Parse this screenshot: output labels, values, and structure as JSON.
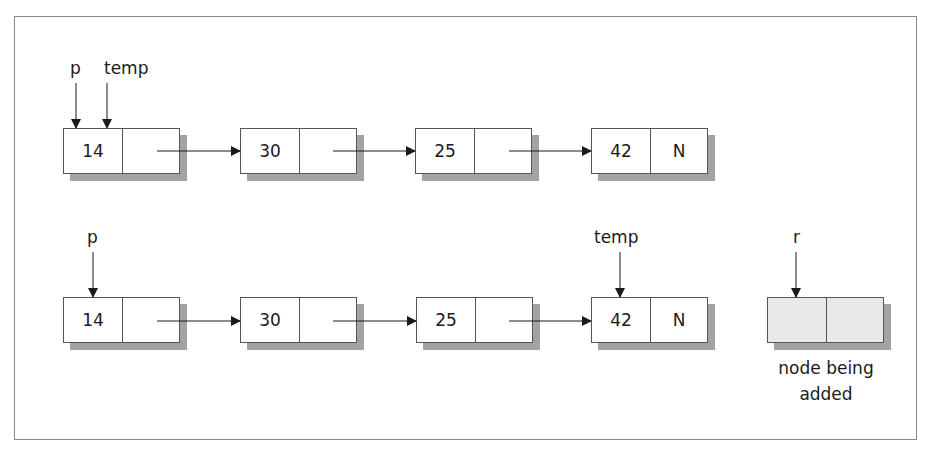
{
  "diagram": {
    "type": "linked-list-insertion",
    "rows": [
      {
        "id": "before",
        "pointers": [
          {
            "name": "p",
            "points_to_node": 0
          },
          {
            "name": "temp",
            "points_to_node": 0
          }
        ],
        "nodes": [
          {
            "data": "14",
            "next": ""
          },
          {
            "data": "30",
            "next": ""
          },
          {
            "data": "25",
            "next": ""
          },
          {
            "data": "42",
            "next": "N"
          }
        ]
      },
      {
        "id": "after-traversal",
        "pointers": [
          {
            "name": "p",
            "points_to_node": 0
          },
          {
            "name": "temp",
            "points_to_node": 3
          }
        ],
        "nodes": [
          {
            "data": "14",
            "next": ""
          },
          {
            "data": "30",
            "next": ""
          },
          {
            "data": "25",
            "next": ""
          },
          {
            "data": "42",
            "next": "N"
          }
        ],
        "new_node": {
          "pointer": "r",
          "data": "",
          "next": "",
          "caption_line1": "node being",
          "caption_line2": "added"
        }
      }
    ]
  },
  "colors": {
    "border": "#555555",
    "frame": "#8a8a8a",
    "shadow": "#a3a3a3",
    "new_node_fill": "#e8e8e8",
    "arrow": "#1a1a1a"
  }
}
